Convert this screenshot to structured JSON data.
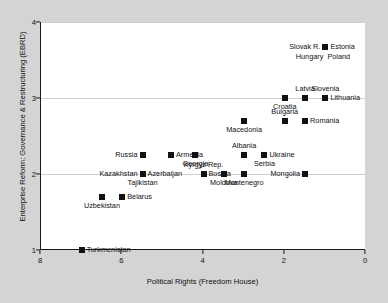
{
  "chart_data": {
    "type": "scatter",
    "title": "",
    "xlabel": "Political Rights (Freedom House)",
    "ylabel": "Enterprise Reform: Governance & Restructuring (EBRD)",
    "xlim": [
      8,
      0
    ],
    "ylim": [
      1,
      4
    ],
    "x_reversed": true,
    "xticks": [
      8,
      6,
      4,
      2,
      0
    ],
    "xtick_labels": [
      "8",
      "6",
      "4",
      "2",
      "0"
    ],
    "yticks": [
      1,
      2,
      3,
      4
    ],
    "ytick_labels": [
      "1",
      "2",
      "3",
      "4"
    ],
    "grid": "horizontal",
    "legend": "none",
    "marker": "filled-square",
    "marker_color": "#111111",
    "points": [
      {
        "label": "Turkmenistan",
        "x": 7.0,
        "y": 1.0,
        "pos": "right"
      },
      {
        "label": "Uzbekistan",
        "x": 6.5,
        "y": 1.7,
        "pos": "below"
      },
      {
        "label": "Belarus",
        "x": 6.0,
        "y": 1.7,
        "pos": "right"
      },
      {
        "label": "Kazakhstan",
        "x": 5.5,
        "y": 2.0,
        "pos": "left"
      },
      {
        "label": "Azerbaijan",
        "x": 5.5,
        "y": 2.0,
        "pos": "right"
      },
      {
        "label": "Tajikistan",
        "x": 5.5,
        "y": 2.0,
        "pos": "below"
      },
      {
        "label": "Russia",
        "x": 5.5,
        "y": 2.25,
        "pos": "left"
      },
      {
        "label": "Armenia",
        "x": 4.8,
        "y": 2.25,
        "pos": "right"
      },
      {
        "label": "Georgia",
        "x": 4.2,
        "y": 2.25,
        "pos": "below"
      },
      {
        "label": "Kyrgyz Rep.",
        "x": 4.0,
        "y": 2.0,
        "pos": "above"
      },
      {
        "label": "Bosnia",
        "x": 4.0,
        "y": 2.0,
        "pos": "right"
      },
      {
        "label": "Moldova",
        "x": 3.5,
        "y": 2.0,
        "pos": "below"
      },
      {
        "label": "Montenegro",
        "x": 3.0,
        "y": 2.0,
        "pos": "below"
      },
      {
        "label": "Albania",
        "x": 3.0,
        "y": 2.25,
        "pos": "above"
      },
      {
        "label": "Macedonia",
        "x": 3.0,
        "y": 2.7,
        "pos": "below"
      },
      {
        "label": "Ukraine",
        "x": 2.5,
        "y": 2.25,
        "pos": "right"
      },
      {
        "label": "Serbia",
        "x": 2.5,
        "y": 2.25,
        "pos": "below"
      },
      {
        "label": "Mongolia",
        "x": 1.5,
        "y": 2.0,
        "pos": "left"
      },
      {
        "label": "Croatia",
        "x": 2.0,
        "y": 3.0,
        "pos": "below"
      },
      {
        "label": "Bulgaria",
        "x": 2.0,
        "y": 2.7,
        "pos": "above"
      },
      {
        "label": "Romania",
        "x": 1.5,
        "y": 2.7,
        "pos": "right"
      },
      {
        "label": "Latvia",
        "x": 1.5,
        "y": 3.0,
        "pos": "above"
      },
      {
        "label": "Slovenia",
        "x": 1.0,
        "y": 3.0,
        "pos": "above"
      },
      {
        "label": "Lithuania",
        "x": 1.0,
        "y": 3.0,
        "pos": "right"
      },
      {
        "label": "Slovak R.",
        "x": 1.0,
        "y": 3.67,
        "pos": "left"
      },
      {
        "label": "Estonia",
        "x": 1.0,
        "y": 3.67,
        "pos": "right"
      },
      {
        "label": "Hungary",
        "x": 1.0,
        "y": 3.67,
        "pos": "below-left"
      },
      {
        "label": "Poland",
        "x": 1.0,
        "y": 3.67,
        "pos": "below-right"
      }
    ]
  }
}
